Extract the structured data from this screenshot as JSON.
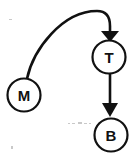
{
  "diagram": {
    "background_color": "#ffffff",
    "stroke_color": "#111111",
    "canvas": {
      "width": 135,
      "height": 157
    },
    "nodes": [
      {
        "id": "M",
        "label": "M",
        "name": "node-m",
        "cx": 24,
        "cy": 95,
        "r": 16.5,
        "label_x": 24,
        "label_y": 95.5
      },
      {
        "id": "T",
        "label": "T",
        "name": "node-t",
        "cx": 109,
        "cy": 57,
        "r": 16.5,
        "label_x": 109,
        "label_y": 57.5
      },
      {
        "id": "B",
        "label": "B",
        "name": "node-b",
        "cx": 111,
        "cy": 135,
        "r": 16.5,
        "label_x": 111,
        "label_y": 135.5
      }
    ],
    "edges": [
      {
        "id": "M-to-T",
        "name": "edge-m-to-t",
        "from": "M",
        "to": "T",
        "style": "curved",
        "path": "M 27 78.8 C 33 50 62 11 97 11 C 107 11 110 18 110 26 L 110 31",
        "arrow_points": "101,31 119,31 110,42",
        "arrow_direction": "down"
      },
      {
        "id": "T-to-B",
        "name": "edge-t-to-b",
        "from": "T",
        "to": "B",
        "style": "straight",
        "path": "M 110 74 L 110 104",
        "arrow_points": "102,103 118,103 110,117",
        "arrow_direction": "down"
      }
    ],
    "specks": [
      {
        "x": 68,
        "y": 123,
        "w": 2,
        "h": 1
      },
      {
        "x": 72,
        "y": 123,
        "w": 3,
        "h": 1
      },
      {
        "x": 78,
        "y": 122,
        "w": 4,
        "h": 2
      },
      {
        "x": 84,
        "y": 123,
        "w": 3,
        "h": 1
      },
      {
        "x": 89,
        "y": 123,
        "w": 2,
        "h": 1
      },
      {
        "x": 11,
        "y": 146,
        "w": 2,
        "h": 3
      },
      {
        "x": 9,
        "y": 19,
        "w": 3,
        "h": 1
      }
    ]
  }
}
